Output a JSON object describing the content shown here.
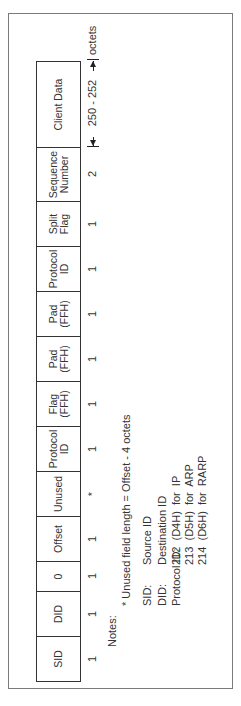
{
  "diagram": {
    "fields": [
      {
        "label": "SID",
        "octets": "1"
      },
      {
        "label": "DID",
        "octets": "1"
      },
      {
        "label": "0",
        "octets": "1"
      },
      {
        "label": "Offset",
        "octets": "1"
      },
      {
        "label": "Unused",
        "octets": "*"
      },
      {
        "label": "Protocol\nID",
        "octets": "1"
      },
      {
        "label": "Flag\n(FFH)",
        "octets": "1"
      },
      {
        "label": "Pad\n(FFH)",
        "octets": "1"
      },
      {
        "label": "Pad\n(FFH)",
        "octets": "1"
      },
      {
        "label": "Protocol\nID",
        "octets": "1"
      },
      {
        "label": "Split\nFlag",
        "octets": "1"
      },
      {
        "label": "Sequence\nNumber",
        "octets": "2"
      },
      {
        "label": "Client Data",
        "octets": ""
      }
    ],
    "client_data_range": "250 - 252",
    "unit_label": "octets"
  },
  "notes": {
    "heading": "Notes:",
    "unused_note": "* Unused field length = Offset - 4 octets",
    "definitions": [
      {
        "term": "SID:",
        "value": "Source ID"
      },
      {
        "term": "DID:",
        "value": "Destination ID"
      },
      {
        "term": "Protocol ID:",
        "value": "212  (D4H)  for  IP"
      }
    ],
    "protocol_extra": [
      "213  (D5H)  for  ARP",
      "214  (D6H)  for  RARP"
    ]
  }
}
